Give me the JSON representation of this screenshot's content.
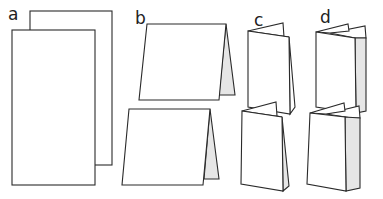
{
  "diagram": {
    "colors": {
      "stroke": "#2a2a2a",
      "paper": "#ffffff",
      "shade": "#e6e6e6"
    },
    "panels": [
      {
        "id": "a",
        "label": "a",
        "name": "two-leaves-unfolded"
      },
      {
        "id": "b",
        "label": "b",
        "name": "single-fold-tent"
      },
      {
        "id": "c",
        "label": "c",
        "name": "concertina-fold"
      },
      {
        "id": "d",
        "label": "d",
        "name": "double-parallel-fold"
      }
    ]
  }
}
